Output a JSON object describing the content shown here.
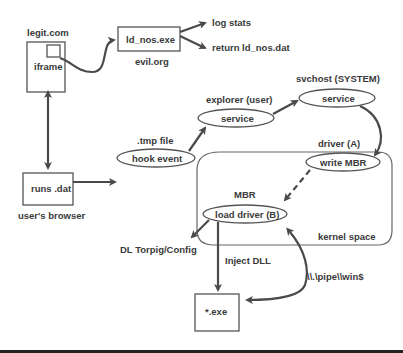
{
  "diagram": {
    "nodes": {
      "legit": {
        "title": "legit.com",
        "label": "iframe"
      },
      "ldnos": {
        "label": "ld_nos.exe",
        "caption": "evil.org"
      },
      "logstats": {
        "label": "log stats"
      },
      "returnld": {
        "label": "return ld_nos.dat"
      },
      "browser": {
        "label": "runs .dat",
        "caption": "user's browser"
      },
      "hook": {
        "label": "hook event",
        "caption": ".tmp file"
      },
      "explorer": {
        "label": "service",
        "caption": "explorer (user)"
      },
      "svchost": {
        "label": "service",
        "caption": "svchost (SYSTEM)"
      },
      "writembr": {
        "label": "write MBR",
        "caption": "driver (A)"
      },
      "loaddriver": {
        "label": "load driver (B)",
        "caption": "MBR"
      },
      "kernel": {
        "label": "kernel space"
      },
      "dl": {
        "label": "DL Torpig/Config"
      },
      "exe": {
        "label": "*.exe"
      }
    },
    "edges": {
      "inject": "Inject DLL",
      "pipe": "\\\\.\\pipe\\\\win$"
    },
    "colors": {
      "stroke": "#4a4a4a",
      "text": "#3a3a3a",
      "background": "#ffffff"
    }
  }
}
